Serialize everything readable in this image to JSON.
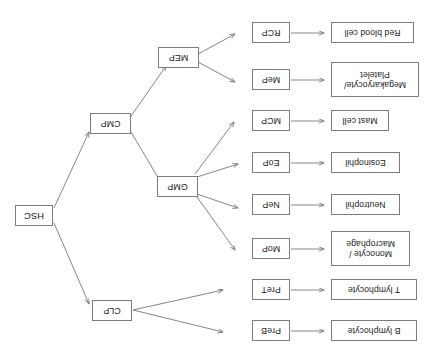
{
  "diagram": {
    "orientation": "rotated-180",
    "background_color": "#ffffff",
    "box_border_color": "#7d7d7d",
    "arrow_color": "#6f6f6f",
    "stem_cell": {
      "id": "HSC",
      "label": "HSC"
    },
    "progenitors_primary": [
      {
        "id": "CLP",
        "label": "CLP"
      },
      {
        "id": "CMP",
        "label": "CMP"
      }
    ],
    "progenitors_secondary": [
      {
        "id": "GMP",
        "label": "GMP"
      },
      {
        "id": "MEP",
        "label": "MEP"
      }
    ],
    "lineages": [
      {
        "id": "PreB",
        "precursor": "PreB",
        "cell": "B lymphocyte",
        "cell_line2": ""
      },
      {
        "id": "PreT",
        "precursor": "PreT",
        "cell": "T lymphocyte",
        "cell_line2": ""
      },
      {
        "id": "MoP",
        "precursor": "MoP",
        "cell": "Monocyte /",
        "cell_line2": "Macrophage"
      },
      {
        "id": "NeP",
        "precursor": "NeP",
        "cell": "Neutrophil",
        "cell_line2": ""
      },
      {
        "id": "EoP",
        "precursor": "EoP",
        "cell": "Eosinophil",
        "cell_line2": ""
      },
      {
        "id": "MCP",
        "precursor": "MCP",
        "cell": "Mast cell",
        "cell_line2": ""
      },
      {
        "id": "MeP",
        "precursor": "MeP",
        "cell": "Megakaryocyte/",
        "cell_line2": "Platelet"
      },
      {
        "id": "RCP",
        "precursor": "RCP",
        "cell": "Red blood cell",
        "cell_line2": ""
      }
    ],
    "edges": [
      {
        "from": "HSC",
        "to": "CLP"
      },
      {
        "from": "HSC",
        "to": "CMP"
      },
      {
        "from": "CMP",
        "to": "GMP"
      },
      {
        "from": "CMP",
        "to": "MEP"
      },
      {
        "from": "CLP",
        "to": "PreB"
      },
      {
        "from": "CLP",
        "to": "PreT"
      },
      {
        "from": "GMP",
        "to": "MoP"
      },
      {
        "from": "GMP",
        "to": "NeP"
      },
      {
        "from": "GMP",
        "to": "EoP"
      },
      {
        "from": "GMP",
        "to": "MCP"
      },
      {
        "from": "MEP",
        "to": "MeP"
      },
      {
        "from": "MEP",
        "to": "RCP"
      },
      {
        "from": "PreB",
        "to": "B lymphocyte"
      },
      {
        "from": "PreT",
        "to": "T lymphocyte"
      },
      {
        "from": "MoP",
        "to": "Monocyte / Macrophage"
      },
      {
        "from": "NeP",
        "to": "Neutrophil"
      },
      {
        "from": "EoP",
        "to": "Eosinophil"
      },
      {
        "from": "MCP",
        "to": "Mast cell"
      },
      {
        "from": "MeP",
        "to": "Megakaryocyte/ Platelet"
      },
      {
        "from": "RCP",
        "to": "Red blood cell"
      }
    ]
  }
}
